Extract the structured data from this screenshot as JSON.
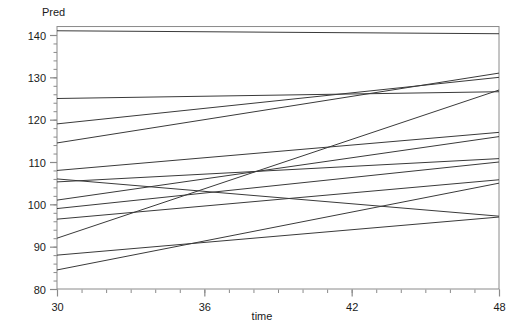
{
  "chart_data": {
    "type": "line",
    "title": "",
    "subtitle": "",
    "xlabel": "time",
    "ylabel": "Pred",
    "xlim": [
      30,
      48
    ],
    "ylim": [
      80,
      142
    ],
    "grid": false,
    "legend": "none",
    "x_ticks": [
      30,
      36,
      42,
      48
    ],
    "x_tick_labels": [
      "30",
      "36",
      "42",
      "48"
    ],
    "x_minor_tick_step": 1,
    "y_ticks": [
      80,
      90,
      100,
      110,
      120,
      130,
      140
    ],
    "y_tick_labels": [
      "80",
      "90",
      "100",
      "110",
      "120",
      "130",
      "140"
    ],
    "y_minor_tick_step": 2,
    "x": [
      30,
      48
    ],
    "series": [
      {
        "name": "subject-01",
        "values": [
          141.0,
          140.3
        ],
        "color": "#3a3a3a"
      },
      {
        "name": "subject-02",
        "values": [
          125.0,
          126.6
        ],
        "color": "#3a3a3a"
      },
      {
        "name": "subject-03",
        "values": [
          119.0,
          130.0
        ],
        "color": "#3a3a3a"
      },
      {
        "name": "subject-04",
        "values": [
          114.5,
          131.0
        ],
        "color": "#3a3a3a"
      },
      {
        "name": "subject-05",
        "values": [
          108.0,
          117.0
        ],
        "color": "#3a3a3a"
      },
      {
        "name": "subject-06",
        "values": [
          106.0,
          97.2
        ],
        "color": "#3a3a3a"
      },
      {
        "name": "subject-07",
        "values": [
          105.3,
          110.8
        ],
        "color": "#3a3a3a"
      },
      {
        "name": "subject-08",
        "values": [
          101.0,
          116.0
        ],
        "color": "#3a3a3a"
      },
      {
        "name": "subject-09",
        "values": [
          99.0,
          110.0
        ],
        "color": "#3a3a3a"
      },
      {
        "name": "subject-10",
        "values": [
          96.5,
          105.8
        ],
        "color": "#3a3a3a"
      },
      {
        "name": "subject-11",
        "values": [
          92.0,
          127.0
        ],
        "color": "#3a3a3a"
      },
      {
        "name": "subject-12",
        "values": [
          88.0,
          97.0
        ],
        "color": "#3a3a3a"
      },
      {
        "name": "subject-13",
        "values": [
          84.5,
          105.0
        ],
        "color": "#3a3a3a"
      }
    ],
    "axis_color": "#8a8a8a",
    "tick_label_color": "#1a1a1a",
    "line_color": "#3a3a3a",
    "background": "#ffffff"
  }
}
